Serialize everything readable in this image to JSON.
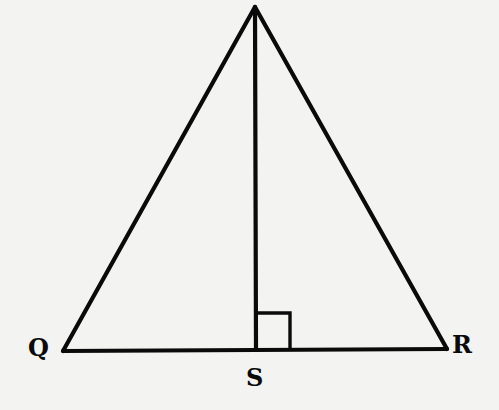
{
  "figure": {
    "type": "triangle-with-altitude",
    "background_color": "#f3f3f1",
    "line_color": "#0a0a0a",
    "vertices": {
      "apex": {
        "label": "",
        "x": 255,
        "y": 7
      },
      "Q": {
        "label": "Q",
        "x": 63,
        "y": 351
      },
      "R": {
        "label": "R",
        "x": 447,
        "y": 349
      },
      "S": {
        "label": "S",
        "x": 256,
        "y": 350
      }
    },
    "segments": [
      {
        "from": "apex",
        "to": "Q",
        "name": "side-apex-Q"
      },
      {
        "from": "apex",
        "to": "R",
        "name": "side-apex-R"
      },
      {
        "from": "Q",
        "to": "R",
        "name": "base-QR"
      },
      {
        "from": "apex",
        "to": "S",
        "name": "altitude-apex-S"
      }
    ],
    "right_angle_marker": {
      "at": "S",
      "size": 34
    },
    "labels": {
      "Q": "Q",
      "S": "S",
      "R": "R"
    }
  }
}
